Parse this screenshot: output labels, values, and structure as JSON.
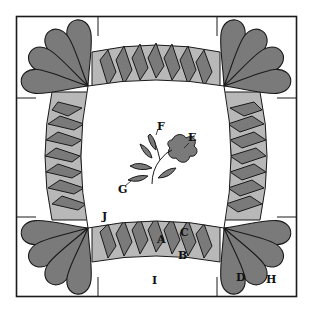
{
  "diagram": {
    "type": "quilt block pattern",
    "colors": {
      "background": "#ffffff",
      "outline": "#1a1a1a",
      "dark_fill": "#7a7a7a",
      "light_fill": "#b8b8b8"
    },
    "labels": {
      "A": "A",
      "B": "B",
      "C": "C",
      "D": "D",
      "E": "E",
      "F": "F",
      "G": "G",
      "H": "H",
      "I": "I",
      "J": "J"
    }
  }
}
